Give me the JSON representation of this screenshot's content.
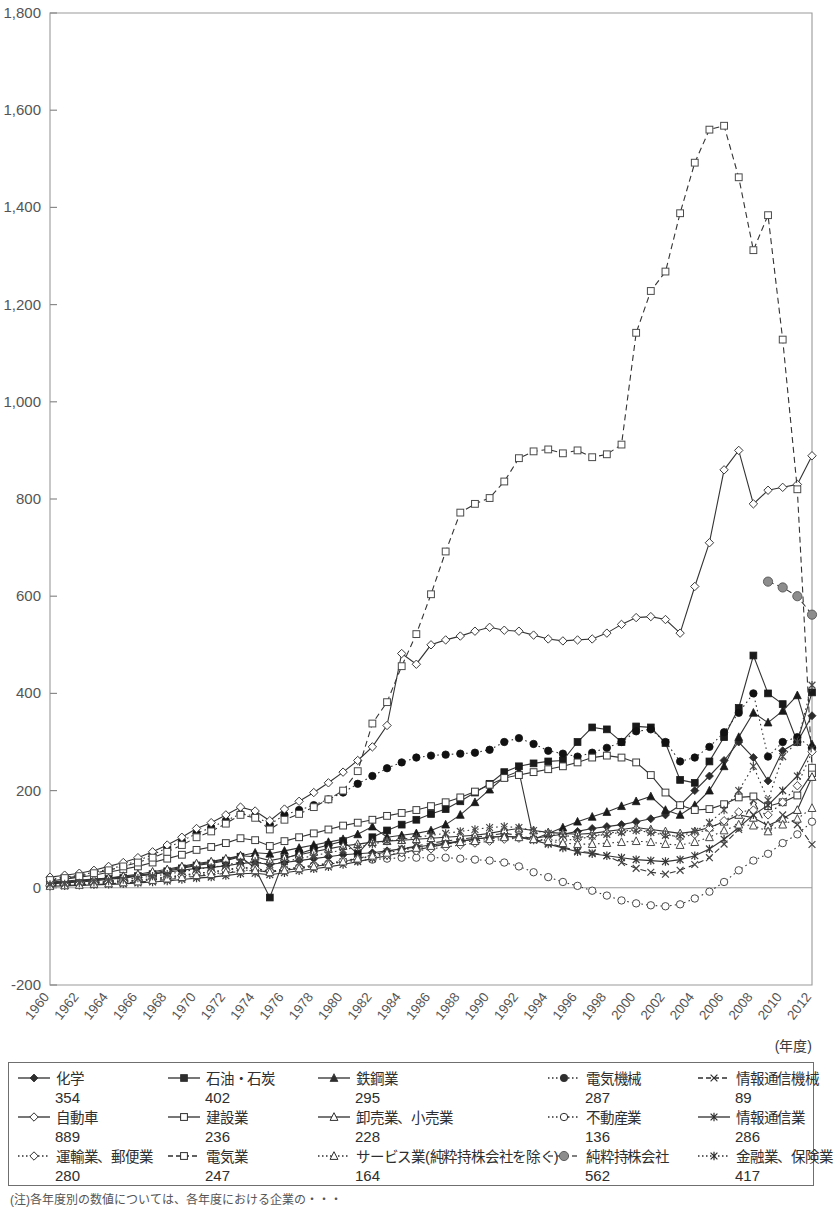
{
  "chart_data": {
    "type": "line",
    "title": "",
    "xlabel": "(年度)",
    "ylabel": "",
    "xlim": [
      1960,
      2012
    ],
    "ylim": [
      -200,
      1800
    ],
    "ytick_step": 200,
    "xtick_step": 2,
    "grid": false,
    "legend_position": "bottom",
    "yticks": [
      "1,800",
      "1,600",
      "1,400",
      "1,200",
      "1,000",
      "800",
      "600",
      "400",
      "200",
      "0",
      "-200"
    ],
    "xticks": [
      "1960",
      "1962",
      "1964",
      "1966",
      "1968",
      "1970",
      "1972",
      "1974",
      "1976",
      "1978",
      "1980",
      "1982",
      "1984",
      "1986",
      "1988",
      "1990",
      "1992",
      "1994",
      "1996",
      "1998",
      "2000",
      "2002",
      "2004",
      "2006",
      "2008",
      "2010",
      "2012"
    ],
    "x": [
      1960,
      1961,
      1962,
      1963,
      1964,
      1965,
      1966,
      1967,
      1968,
      1969,
      1970,
      1971,
      1972,
      1973,
      1974,
      1975,
      1976,
      1977,
      1978,
      1979,
      1980,
      1981,
      1982,
      1983,
      1984,
      1985,
      1986,
      1987,
      1988,
      1989,
      1990,
      1991,
      1992,
      1993,
      1994,
      1995,
      1996,
      1997,
      1998,
      1999,
      2000,
      2001,
      2002,
      2003,
      2004,
      2005,
      2006,
      2007,
      2008,
      2009,
      2010,
      2011,
      2012
    ],
    "series": [
      {
        "name": "化学",
        "final_value": 354,
        "marker": "filled-diamond",
        "line": "solid",
        "color": "#2b2b2b",
        "values": [
          12,
          14,
          16,
          18,
          20,
          22,
          25,
          28,
          32,
          36,
          40,
          42,
          45,
          50,
          52,
          48,
          52,
          56,
          60,
          64,
          68,
          70,
          72,
          76,
          80,
          84,
          88,
          92,
          96,
          100,
          104,
          106,
          104,
          102,
          106,
          110,
          116,
          122,
          126,
          130,
          136,
          142,
          150,
          170,
          200,
          230,
          262,
          300,
          268,
          220,
          282,
          300,
          354
        ]
      },
      {
        "name": "石油・石炭",
        "final_value": 402,
        "marker": "filled-square",
        "line": "solid",
        "color": "#1a1a1a",
        "values": [
          8,
          10,
          12,
          14,
          18,
          20,
          24,
          28,
          34,
          40,
          46,
          50,
          56,
          64,
          40,
          -20,
          60,
          70,
          80,
          88,
          96,
          70,
          104,
          118,
          130,
          140,
          152,
          162,
          178,
          196,
          214,
          238,
          250,
          256,
          260,
          262,
          300,
          330,
          326,
          300,
          332,
          330,
          298,
          222,
          216,
          260,
          310,
          370,
          478,
          400,
          378,
          300,
          402
        ]
      },
      {
        "name": "鉄鋼業",
        "final_value": 295,
        "marker": "filled-triangle",
        "line": "solid",
        "color": "#1a1a1a",
        "values": [
          10,
          12,
          14,
          16,
          20,
          22,
          26,
          30,
          36,
          42,
          48,
          52,
          58,
          66,
          72,
          70,
          76,
          82,
          88,
          94,
          100,
          110,
          126,
          104,
          108,
          112,
          118,
          130,
          150,
          176,
          202,
          228,
          240,
          100,
          112,
          124,
          136,
          146,
          156,
          168,
          178,
          188,
          160,
          150,
          170,
          200,
          250,
          310,
          360,
          340,
          364,
          396,
          295
        ]
      },
      {
        "name": "電気機械",
        "final_value": 287,
        "marker": "filled-circle",
        "line": "dotted",
        "color": "#111111",
        "values": [
          18,
          22,
          26,
          32,
          38,
          46,
          56,
          68,
          82,
          96,
          112,
          124,
          138,
          152,
          148,
          130,
          150,
          160,
          170,
          182,
          196,
          214,
          230,
          246,
          258,
          268,
          272,
          274,
          276,
          278,
          284,
          300,
          308,
          296,
          282,
          276,
          270,
          278,
          288,
          300,
          322,
          326,
          300,
          260,
          268,
          290,
          320,
          360,
          400,
          270,
          300,
          310,
          287
        ]
      },
      {
        "name": "情報通信機械",
        "final_value": 89,
        "marker": "cross-x",
        "line": "dashed",
        "color": "#444444",
        "values": [
          4,
          5,
          6,
          7,
          8,
          10,
          12,
          14,
          17,
          20,
          24,
          26,
          30,
          34,
          36,
          32,
          36,
          40,
          44,
          48,
          54,
          60,
          68,
          74,
          80,
          86,
          92,
          96,
          100,
          104,
          108,
          112,
          108,
          100,
          92,
          84,
          76,
          72,
          66,
          52,
          40,
          32,
          28,
          36,
          48,
          62,
          90,
          120,
          180,
          120,
          150,
          130,
          89
        ]
      },
      {
        "name": "自動車",
        "final_value": 889,
        "marker": "open-diamond",
        "line": "solid",
        "color": "#3a3a3a",
        "values": [
          22,
          26,
          30,
          36,
          44,
          52,
          62,
          74,
          88,
          104,
          122,
          134,
          150,
          166,
          158,
          138,
          162,
          178,
          196,
          216,
          238,
          262,
          290,
          334,
          482,
          460,
          500,
          510,
          518,
          528,
          536,
          530,
          528,
          520,
          512,
          508,
          510,
          512,
          524,
          542,
          556,
          558,
          552,
          524,
          620,
          710,
          860,
          900,
          790,
          818,
          824,
          830,
          889
        ]
      },
      {
        "name": "建設業",
        "final_value": 236,
        "marker": "open-square",
        "line": "solid",
        "color": "#3a3a3a",
        "values": [
          14,
          18,
          22,
          26,
          32,
          38,
          44,
          52,
          60,
          68,
          78,
          84,
          92,
          102,
          98,
          86,
          96,
          104,
          112,
          120,
          128,
          134,
          140,
          148,
          154,
          160,
          168,
          176,
          186,
          198,
          212,
          226,
          232,
          238,
          244,
          250,
          258,
          268,
          272,
          268,
          258,
          232,
          196,
          170,
          160,
          162,
          172,
          186,
          188,
          168,
          176,
          190,
          236
        ]
      },
      {
        "name": "卸売業、小売業",
        "final_value": 228,
        "marker": "open-triangle-up",
        "line": "solid",
        "color": "#3a3a3a",
        "values": [
          10,
          12,
          14,
          17,
          20,
          24,
          28,
          33,
          38,
          44,
          50,
          54,
          60,
          66,
          64,
          56,
          62,
          68,
          74,
          80,
          86,
          90,
          94,
          96,
          98,
          100,
          102,
          104,
          106,
          108,
          112,
          118,
          122,
          118,
          114,
          112,
          110,
          112,
          116,
          120,
          124,
          120,
          116,
          112,
          116,
          124,
          136,
          150,
          144,
          128,
          142,
          160,
          228
        ]
      },
      {
        "name": "不動産業",
        "final_value": 136,
        "marker": "open-circle",
        "line": "dotted",
        "color": "#4a4a4a",
        "values": [
          6,
          7,
          8,
          10,
          12,
          14,
          16,
          19,
          22,
          26,
          30,
          33,
          37,
          42,
          40,
          34,
          38,
          42,
          46,
          50,
          54,
          56,
          58,
          60,
          62,
          62,
          62,
          62,
          60,
          58,
          56,
          52,
          44,
          32,
          22,
          12,
          4,
          -6,
          -16,
          -26,
          -32,
          -36,
          -38,
          -34,
          -22,
          -8,
          12,
          36,
          56,
          70,
          92,
          110,
          136
        ]
      },
      {
        "name": "情報通信業",
        "final_value": 286,
        "marker": "star-x",
        "line": "solid",
        "color": "#3a3a3a",
        "values": [
          3,
          4,
          5,
          6,
          7,
          8,
          10,
          12,
          14,
          17,
          20,
          22,
          25,
          29,
          30,
          27,
          31,
          35,
          39,
          43,
          48,
          54,
          60,
          66,
          72,
          78,
          84,
          90,
          96,
          100,
          104,
          106,
          104,
          98,
          90,
          82,
          74,
          70,
          66,
          62,
          58,
          56,
          54,
          58,
          66,
          80,
          100,
          124,
          150,
          170,
          200,
          230,
          286
        ]
      },
      {
        "name": "運輸業、郵便業",
        "final_value": 280,
        "marker": "open-diamond",
        "line": "dotted",
        "color": "#4a4a4a",
        "values": [
          5,
          6,
          8,
          9,
          11,
          13,
          15,
          18,
          21,
          25,
          29,
          32,
          36,
          41,
          40,
          34,
          38,
          42,
          46,
          50,
          56,
          60,
          64,
          68,
          72,
          76,
          80,
          84,
          88,
          92,
          96,
          100,
          102,
          100,
          98,
          98,
          100,
          106,
          112,
          116,
          120,
          116,
          110,
          104,
          110,
          122,
          138,
          156,
          160,
          150,
          176,
          210,
          280
        ]
      },
      {
        "name": "電気業",
        "final_value": 247,
        "marker": "open-square",
        "line": "dashed",
        "color": "#4a4a4a",
        "values": [
          16,
          20,
          24,
          30,
          36,
          44,
          52,
          62,
          74,
          88,
          104,
          116,
          132,
          150,
          144,
          120,
          140,
          152,
          166,
          182,
          200,
          240,
          338,
          382,
          456,
          522,
          604,
          692,
          772,
          790,
          802,
          836,
          884,
          898,
          902,
          894,
          900,
          886,
          892,
          912,
          1142,
          1228,
          1268,
          1388,
          1492,
          1560,
          1568,
          1462,
          1312,
          1384,
          1128,
          820,
          247
        ]
      },
      {
        "name": "サービス業(純粋持株会社を除く)",
        "final_value": 164,
        "marker": "open-triangle-up",
        "line": "dotted",
        "color": "#4a4a4a",
        "values": [
          4,
          5,
          6,
          8,
          9,
          11,
          13,
          16,
          19,
          22,
          26,
          28,
          32,
          36,
          36,
          32,
          36,
          40,
          44,
          48,
          54,
          60,
          66,
          72,
          78,
          82,
          86,
          90,
          94,
          96,
          100,
          104,
          104,
          100,
          96,
          92,
          90,
          90,
          92,
          94,
          96,
          94,
          90,
          88,
          94,
          104,
          118,
          130,
          128,
          116,
          130,
          142,
          164
        ]
      },
      {
        "name": "純粋持株会社",
        "final_value": 562,
        "marker": "gray-circle",
        "line": "dashed",
        "color": "#808080",
        "start_year": 2009,
        "values": [
          null,
          null,
          null,
          null,
          null,
          null,
          null,
          null,
          null,
          null,
          null,
          null,
          null,
          null,
          null,
          null,
          null,
          null,
          null,
          null,
          null,
          null,
          null,
          null,
          null,
          null,
          null,
          null,
          null,
          null,
          null,
          null,
          null,
          null,
          null,
          null,
          null,
          null,
          null,
          null,
          null,
          null,
          null,
          null,
          null,
          null,
          null,
          null,
          null,
          630,
          618,
          600,
          562
        ]
      },
      {
        "name": "金融業、保険業",
        "final_value": 417,
        "marker": "star-x",
        "line": "dotted",
        "color": "#4a4a4a",
        "values": [
          7,
          8,
          10,
          12,
          14,
          17,
          20,
          24,
          28,
          33,
          38,
          42,
          47,
          53,
          54,
          48,
          54,
          60,
          66,
          72,
          78,
          84,
          90,
          96,
          100,
          104,
          108,
          112,
          116,
          120,
          124,
          126,
          124,
          118,
          112,
          108,
          104,
          106,
          110,
          114,
          118,
          114,
          108,
          106,
          116,
          134,
          160,
          200,
          250,
          180,
          270,
          300,
          417
        ]
      }
    ]
  },
  "legend": {
    "rows": [
      [
        {
          "label": "化学",
          "value": "354",
          "marker": "filled-diamond",
          "line": "solid"
        },
        {
          "label": "石油・石炭",
          "value": "402",
          "marker": "filled-square",
          "line": "solid"
        },
        {
          "label": "鉄鋼業",
          "value": "295",
          "marker": "filled-triangle",
          "line": "solid"
        },
        {
          "label": "電気機械",
          "value": "287",
          "marker": "filled-circle",
          "line": "dotted"
        },
        {
          "label": "情報通信機械",
          "value": "89",
          "marker": "cross-x",
          "line": "dashed"
        }
      ],
      [
        {
          "label": "自動車",
          "value": "889",
          "marker": "open-diamond",
          "line": "solid"
        },
        {
          "label": "建設業",
          "value": "236",
          "marker": "open-square",
          "line": "solid"
        },
        {
          "label": "卸売業、小売業",
          "value": "228",
          "marker": "open-triangle-up",
          "line": "solid"
        },
        {
          "label": "不動産業",
          "value": "136",
          "marker": "open-circle",
          "line": "dotted"
        },
        {
          "label": "情報通信業",
          "value": "286",
          "marker": "star-x",
          "line": "solid"
        }
      ],
      [
        {
          "label": "運輸業、郵便業",
          "value": "280",
          "marker": "open-diamond",
          "line": "dotted"
        },
        {
          "label": "電気業",
          "value": "247",
          "marker": "open-square",
          "line": "dashed"
        },
        {
          "label": "サービス業(純粋持株会社を除く)",
          "value": "164",
          "marker": "open-triangle-up",
          "line": "dotted"
        },
        {
          "label": "純粋持株会社",
          "value": "562",
          "marker": "gray-circle",
          "line": "dashed"
        },
        {
          "label": "金融業、保険業",
          "value": "417",
          "marker": "star-x",
          "line": "dotted"
        }
      ]
    ]
  },
  "footnote": "(注)各年度別の数値については、各年度における企業の・・・"
}
